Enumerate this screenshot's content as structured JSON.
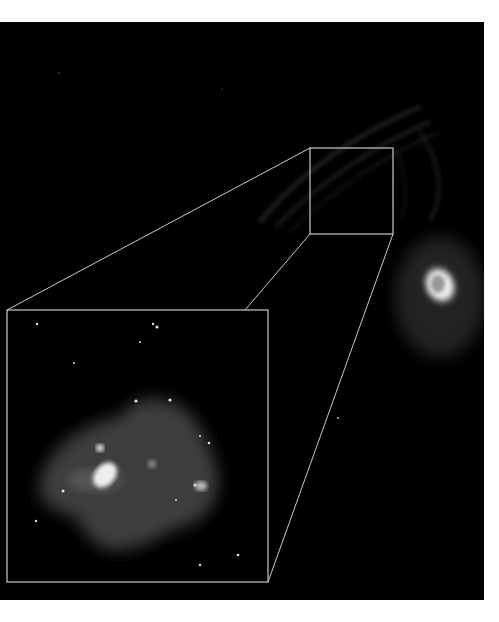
{
  "image": {
    "subject": "astronomical nebula with zoomed inset",
    "background_color": "#000000",
    "frame_line_color": "#c8c8c8",
    "source_box": {
      "x": 310,
      "y": 126,
      "w": 83,
      "h": 86
    },
    "inset_box": {
      "x": 7,
      "y": 288,
      "w": 261,
      "h": 272
    },
    "bright_nebula": {
      "cx": 440,
      "cy": 263
    }
  }
}
